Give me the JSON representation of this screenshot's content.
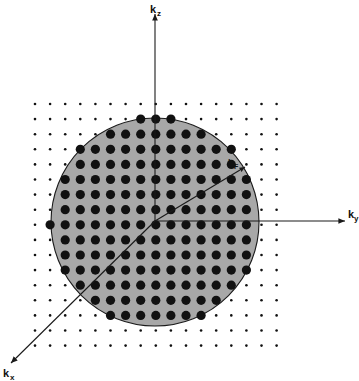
{
  "figure": {
    "background_color": "#ffffff",
    "width": 359,
    "height": 381
  },
  "axes": {
    "origin": {
      "x": 155,
      "y": 221
    },
    "items": [
      {
        "id": "kz",
        "label": "k",
        "subscript": "z",
        "direction": "up",
        "tip": {
          "x": 155,
          "y": 14
        },
        "label_pos": {
          "x": 150,
          "y": 13
        },
        "sub_pos": {
          "x": 157,
          "y": 16
        }
      },
      {
        "id": "ky",
        "label": "k",
        "subscript": "y",
        "direction": "right",
        "tip": {
          "x": 345,
          "y": 221
        },
        "label_pos": {
          "x": 348,
          "y": 218
        },
        "sub_pos": {
          "x": 354,
          "y": 221
        }
      },
      {
        "id": "kx",
        "label": "k",
        "subscript": "x",
        "direction": "down-left",
        "tip": {
          "x": 11,
          "y": 363
        },
        "label_pos": {
          "x": 3,
          "y": 377
        },
        "sub_pos": {
          "x": 10,
          "y": 380
        }
      }
    ],
    "line_color": "#1a1a1a",
    "line_width": 1.1
  },
  "fermi_sphere": {
    "center": {
      "x": 155,
      "y": 222
    },
    "radius": 104,
    "fill_color": "#a8a8a8",
    "stroke_color": "#1a1a1a",
    "stroke_width": 1.1
  },
  "radius_arrow": {
    "id": "kF",
    "label": "k",
    "subscript": "F",
    "from": {
      "x": 155,
      "y": 221
    },
    "to": {
      "x": 245,
      "y": 167
    },
    "label_pos": {
      "x": 228,
      "y": 166
    },
    "sub_pos": {
      "x": 234,
      "y": 169
    },
    "color": "#1a1a1a"
  },
  "lattice": {
    "description": "Square grid of allowed k-states; large filled dots are occupied states inside the Fermi sphere, small dots are unoccupied states outside.",
    "spacing": 15.1,
    "x_start": 35,
    "y_start": 104,
    "columns": 17,
    "rows": 17,
    "inside_dot_radius": 4.6,
    "outside_dot_radius": 1.3,
    "dot_color": "#111111"
  },
  "chart_data": {
    "type": "scatter",
    "xlabel": "k_y",
    "ylabel": "k_z",
    "zlabel": "k_x",
    "annotations": [
      "k_F"
    ],
    "legend": [],
    "grid": true,
    "series": [
      {
        "name": "occupied states (inside Fermi sphere)",
        "marker": "large filled circle",
        "count_approx": 141
      },
      {
        "name": "unoccupied states (outside Fermi sphere)",
        "marker": "small filled dot",
        "count_approx": 148
      }
    ],
    "sphere_radius_in_lattice_units": 6.9
  }
}
